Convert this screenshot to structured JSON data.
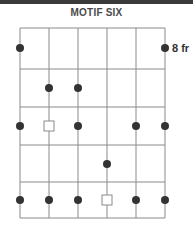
{
  "title": "MOTIF SIX",
  "fret_label": "8 fr",
  "colors": {
    "topbar": "#3a3a3a",
    "grid": "#8a8a8a",
    "dot": "#333333",
    "square_stroke": "#8a8a8a",
    "square_fill": "#ffffff"
  },
  "diagram": {
    "strings": 6,
    "frets": 5,
    "start_fret": 8,
    "string_x": [
      20,
      49,
      78,
      107,
      136,
      165
    ],
    "fret_y": [
      28,
      69,
      107,
      145,
      182,
      218
    ],
    "row_center_y": [
      48,
      88,
      126,
      164,
      200
    ],
    "markers": [
      {
        "row": 1,
        "string": 1,
        "type": "dot"
      },
      {
        "row": 1,
        "string": 6,
        "type": "dot"
      },
      {
        "row": 2,
        "string": 2,
        "type": "dot"
      },
      {
        "row": 2,
        "string": 3,
        "type": "dot"
      },
      {
        "row": 3,
        "string": 1,
        "type": "dot"
      },
      {
        "row": 3,
        "string": 2,
        "type": "square"
      },
      {
        "row": 3,
        "string": 3,
        "type": "dot"
      },
      {
        "row": 3,
        "string": 5,
        "type": "dot"
      },
      {
        "row": 3,
        "string": 6,
        "type": "dot"
      },
      {
        "row": 4,
        "string": 4,
        "type": "dot"
      },
      {
        "row": 5,
        "string": 1,
        "type": "dot"
      },
      {
        "row": 5,
        "string": 2,
        "type": "dot"
      },
      {
        "row": 5,
        "string": 3,
        "type": "dot"
      },
      {
        "row": 5,
        "string": 4,
        "type": "square"
      },
      {
        "row": 5,
        "string": 5,
        "type": "dot"
      },
      {
        "row": 5,
        "string": 6,
        "type": "dot"
      }
    ]
  }
}
